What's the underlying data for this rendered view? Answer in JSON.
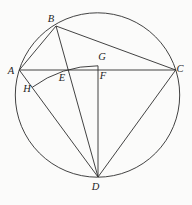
{
  "figure": {
    "name": "circle-geometry-diagram",
    "background": "#fbfbfa",
    "line_color": "#2e2e2e",
    "label_color": "#1d1d1d",
    "stroke_width": 0.9,
    "canvas": {
      "width": 192,
      "height": 205
    },
    "circle": {
      "cx": 97.5,
      "cy": 95,
      "r": 82.2
    },
    "points": {
      "A": {
        "x": 19.3,
        "y": 70,
        "label": "A",
        "lx": 11,
        "ly": 73.5
      },
      "B": {
        "x": 56,
        "y": 26,
        "label": "B",
        "lx": 51,
        "ly": 21.5
      },
      "C": {
        "x": 175.7,
        "y": 70,
        "label": "C",
        "lx": 180,
        "ly": 71.5
      },
      "D": {
        "x": 98,
        "y": 177,
        "label": "D",
        "lx": 95.5,
        "ly": 189.5
      },
      "E": {
        "x": 68.2,
        "y": 70,
        "label": "E",
        "lx": 62,
        "ly": 81
      },
      "F": {
        "x": 98,
        "y": 70,
        "label": "F",
        "lx": 103,
        "ly": 78.5
      },
      "G": {
        "x": 98,
        "y": 65.8,
        "label": "G",
        "lx": 102,
        "ly": 60
      },
      "H": {
        "x": 32.1,
        "y": 87.4,
        "label": "H",
        "lx": 27,
        "ly": 91.5
      }
    },
    "segments": [
      {
        "from": "A",
        "to": "C"
      },
      {
        "from": "A",
        "to": "B"
      },
      {
        "from": "B",
        "to": "C"
      },
      {
        "from": "B",
        "to": "D"
      },
      {
        "from": "A",
        "to": "D"
      },
      {
        "from": "C",
        "to": "D"
      },
      {
        "from": "G",
        "to": "D"
      }
    ],
    "arc": {
      "center": "D",
      "from": "H",
      "to": "G",
      "radius": 111.2,
      "large_arc": 0,
      "sweep": 1
    }
  }
}
